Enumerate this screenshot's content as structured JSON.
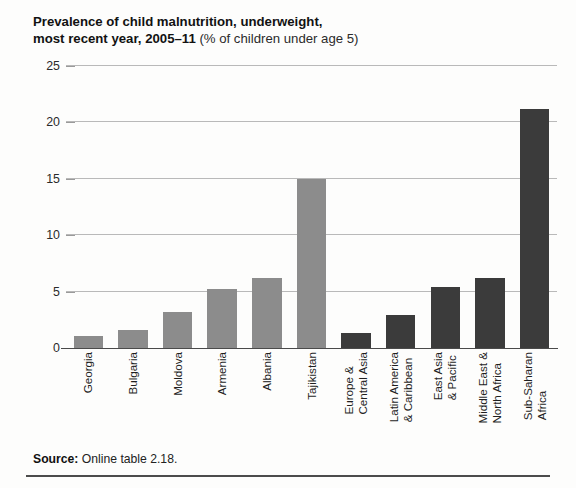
{
  "figure": {
    "title_line1": "Prevalence of child malnutrition, underweight,",
    "title_line2_strong": "most recent year, 2005–11",
    "title_line2_light": " (% of children under age 5)",
    "source_label": "Source:",
    "source_text": " Online table 2.18."
  },
  "colors": {
    "bar_light": "#8c8c8c",
    "bar_dark": "#3b3b3b",
    "gridline": "#b9b9b9",
    "axis": "#4a4a4a",
    "text": "#1b1b1b"
  },
  "chart_data": {
    "type": "bar",
    "title": "Prevalence of child malnutrition, underweight, most recent year, 2005–11 (% of children under age 5)",
    "xlabel": "",
    "ylabel": "",
    "ylim": [
      0,
      25
    ],
    "yticks": [
      0,
      5,
      10,
      15,
      20,
      25
    ],
    "ytick_labels": [
      "0",
      "5",
      "10",
      "15",
      "20",
      "25"
    ],
    "grid": true,
    "legend": "none",
    "categories": [
      "Georgia",
      "Bulgaria",
      "Moldova",
      "Armenia",
      "Albania",
      "Tajikistan",
      "Europe &\nCentral Asia",
      "Latin America\n& Caribbean",
      "East Asia\n& Pacific",
      "Middle East &\nNorth Africa",
      "Sub-Saharan\nAfrica"
    ],
    "values": [
      1.1,
      1.6,
      3.2,
      5.2,
      6.2,
      15.0,
      1.3,
      2.9,
      5.4,
      6.2,
      21.2
    ],
    "group": [
      "country",
      "country",
      "country",
      "country",
      "country",
      "country",
      "region",
      "region",
      "region",
      "region",
      "region"
    ]
  }
}
